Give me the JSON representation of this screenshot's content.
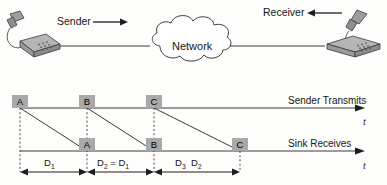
{
  "diagram": {
    "title_alt": "Network jitter timing diagram",
    "background_color": "#fdfdfb",
    "line_color": "#3a3a3a",
    "box_fill": "#a9a9a9",
    "dash_color": "#4a4a4a"
  },
  "topology": {
    "sender_label": "Sender",
    "receiver_label": "Receiver",
    "network_label": "Network",
    "sender_phone_icon": "telephone-icon",
    "receiver_phone_icon": "telephone-icon",
    "cloud_icon": "cloud-icon",
    "sender_arrow_icon": "arrow-right-icon",
    "receiver_arrow_icon": "arrow-left-icon"
  },
  "timing": {
    "transmit_axis_label": "Sender Transmits",
    "receive_axis_label": "Sink Receives",
    "time_axis_symbol_top": "t",
    "time_axis_symbol_bottom": "t",
    "transmit_events": [
      {
        "label": "A",
        "x": 20
      },
      {
        "label": "B",
        "x": 87
      },
      {
        "label": "C",
        "x": 154
      }
    ],
    "receive_events": [
      {
        "label": "A",
        "x": 87
      },
      {
        "label": "B",
        "x": 154
      },
      {
        "label": "C",
        "x": 240
      }
    ],
    "delays": [
      {
        "text": "D",
        "sub": "1",
        "suffix": "",
        "x": 44,
        "y": 157
      },
      {
        "text": "D",
        "sub": "2",
        "suffix": " = D",
        "suffix_sub": "1",
        "x": 97,
        "y": 157
      },
      {
        "text": "D",
        "sub": "3",
        "suffix": "  D",
        "suffix_sub": "2",
        "x": 175,
        "y": 157
      }
    ],
    "delay_spans": [
      {
        "from": 20,
        "to": 87
      },
      {
        "from": 87,
        "to": 154
      },
      {
        "from": 154,
        "to": 240
      }
    ]
  }
}
